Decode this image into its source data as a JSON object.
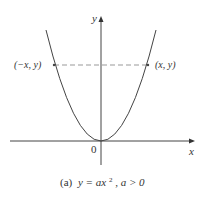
{
  "figure": {
    "y_axis_label": "y",
    "x_axis_label": "x",
    "origin_label": "0",
    "left_point_label": "(−x, y)",
    "right_point_label": "(x, y)",
    "caption_prefix": "(a)",
    "caption_eq_lhs": "y",
    "caption_eq_rhs": "= ax",
    "caption_exponent": "2",
    "caption_condition": ",  a > 0",
    "colors": {
      "curve": "#444444",
      "axis": "#444444",
      "dashed": "#999999",
      "text": "#333333"
    }
  }
}
